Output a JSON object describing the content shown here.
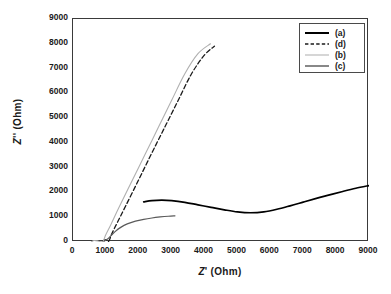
{
  "chart_data": {
    "type": "line",
    "title": "",
    "xlabel": "Z' (Ohm)",
    "ylabel": "Z'' (Ohm)",
    "xlim": [
      0,
      9000
    ],
    "ylim": [
      0,
      9000
    ],
    "xticks": [
      0,
      1000,
      2000,
      3000,
      4000,
      5000,
      6000,
      7000,
      8000,
      9000
    ],
    "yticks": [
      0,
      1000,
      2000,
      3000,
      4000,
      5000,
      6000,
      7000,
      8000,
      9000
    ],
    "grid": false,
    "legend_position": "top-right",
    "series": [
      {
        "name": "(a)",
        "style": "solid",
        "color": "#000000",
        "width": 1.7,
        "points": [
          [
            2150,
            1620
          ],
          [
            2400,
            1670
          ],
          [
            2700,
            1690
          ],
          [
            3000,
            1670
          ],
          [
            3400,
            1600
          ],
          [
            3800,
            1500
          ],
          [
            4200,
            1400
          ],
          [
            4600,
            1300
          ],
          [
            5000,
            1215
          ],
          [
            5400,
            1180
          ],
          [
            5800,
            1215
          ],
          [
            6200,
            1320
          ],
          [
            6600,
            1460
          ],
          [
            7000,
            1610
          ],
          [
            7400,
            1760
          ],
          [
            7800,
            1900
          ],
          [
            8200,
            2040
          ],
          [
            8600,
            2170
          ],
          [
            9000,
            2280
          ]
        ]
      },
      {
        "name": "(d)",
        "style": "dashed",
        "color": "#1a1a1a",
        "width": 1.3,
        "points": [
          [
            900,
            30
          ],
          [
            960,
            90
          ],
          [
            1010,
            80
          ],
          [
            1040,
            40
          ],
          [
            1060,
            15
          ],
          [
            1100,
            60
          ],
          [
            1180,
            330
          ],
          [
            1300,
            660
          ],
          [
            1600,
            1450
          ],
          [
            2000,
            2520
          ],
          [
            2400,
            3600
          ],
          [
            2800,
            4660
          ],
          [
            3200,
            5720
          ],
          [
            3600,
            6780
          ],
          [
            4000,
            7550
          ],
          [
            4300,
            7900
          ]
        ]
      },
      {
        "name": "(b)",
        "style": "solid",
        "color": "#b0b0b0",
        "width": 1.1,
        "points": [
          [
            560,
            10
          ],
          [
            640,
            60
          ],
          [
            760,
            40
          ],
          [
            860,
            5
          ],
          [
            920,
            40
          ],
          [
            1000,
            300
          ],
          [
            1150,
            700
          ],
          [
            1400,
            1400
          ],
          [
            1800,
            2480
          ],
          [
            2200,
            3560
          ],
          [
            2600,
            4640
          ],
          [
            3000,
            5720
          ],
          [
            3400,
            6790
          ],
          [
            3800,
            7600
          ],
          [
            4180,
            8000
          ]
        ]
      },
      {
        "name": "(c)",
        "style": "solid",
        "color": "#5a5a5a",
        "width": 1.2,
        "points": [
          [
            950,
            35
          ],
          [
            1050,
            120
          ],
          [
            1150,
            250
          ],
          [
            1280,
            420
          ],
          [
            1450,
            590
          ],
          [
            1650,
            730
          ],
          [
            1900,
            840
          ],
          [
            2150,
            915
          ],
          [
            2400,
            970
          ],
          [
            2650,
            1010
          ],
          [
            2900,
            1040
          ],
          [
            3100,
            1055
          ]
        ]
      }
    ]
  },
  "legend": {
    "entries": [
      {
        "label": "(a)",
        "style": "solid",
        "color": "#000000",
        "width": 2.0
      },
      {
        "label": "(d)",
        "style": "dashed",
        "color": "#1a1a1a",
        "width": 1.4
      },
      {
        "label": "(b)",
        "style": "solid",
        "color": "#b5b5b5",
        "width": 1.1
      },
      {
        "label": "(c)",
        "style": "solid",
        "color": "#555555",
        "width": 1.4
      }
    ]
  },
  "colors": {
    "frame": "#3a3a3a",
    "background": "#ffffff",
    "text": "#1a1a1a"
  }
}
